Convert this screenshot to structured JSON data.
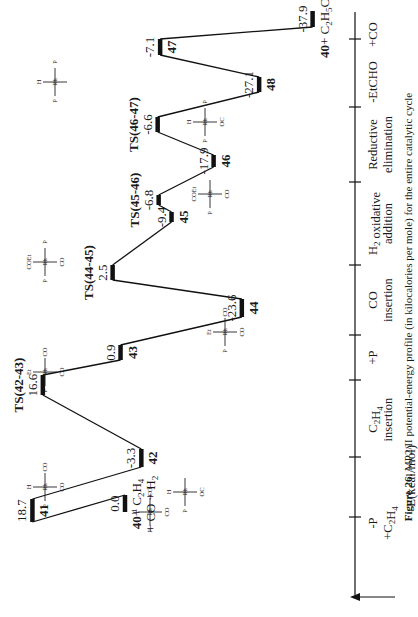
{
  "figure": {
    "caption_label": "Figure 26.",
    "caption_text": "MP2/II potential-energy profile (in kilocalories per mole) for the entire catalytic cycle",
    "axis_label": "E(kcal/mol)"
  },
  "chart_data": {
    "type": "line",
    "xlabel": "Reaction coordinate",
    "ylabel": "E(kcal/mol)",
    "orientation": "rotated 90 degrees counter-clockwise",
    "points": [
      {
        "id": "40",
        "label": "40 + C2H4 + CO + H2",
        "energy": 0.0,
        "pos": 0
      },
      {
        "id": "41",
        "label": "41",
        "energy": 18.7,
        "pos": 1
      },
      {
        "id": "42",
        "label": "42",
        "energy": -3.3,
        "pos": 2
      },
      {
        "id": "TS(42-43)",
        "label": "TS(42-43)",
        "energy": 16.6,
        "pos": 3
      },
      {
        "id": "43",
        "label": "43",
        "energy": 0.9,
        "pos": 4
      },
      {
        "id": "44",
        "label": "44",
        "energy": -23.6,
        "pos": 5
      },
      {
        "id": "TS(44-45)",
        "label": "TS(44-45)",
        "energy": 2.5,
        "pos": 6
      },
      {
        "id": "45",
        "label": "45",
        "energy": -9.4,
        "pos": 7
      },
      {
        "id": "TS(45-46)",
        "label": "TS(45-46)",
        "energy": -6.8,
        "pos": 8
      },
      {
        "id": "46",
        "label": "46",
        "energy": -17.9,
        "pos": 9
      },
      {
        "id": "TS(46-47)",
        "label": "TS(46-47)",
        "energy": -6.6,
        "pos": 10
      },
      {
        "id": "48",
        "label": "48",
        "energy": -27.1,
        "pos": 11
      },
      {
        "id": "47",
        "label": "47",
        "energy": -7.1,
        "pos": 12
      },
      {
        "id": "40b",
        "label": "40 + C2H5CHO",
        "energy": -37.9,
        "pos": 13
      }
    ],
    "steps": [
      {
        "line1": "-P",
        "line2": "+C2H4"
      },
      {
        "line1": "C2H4",
        "line2": "insertion"
      },
      {
        "line1": "+P",
        "line2": ""
      },
      {
        "line1": "CO",
        "line2": "insertion"
      },
      {
        "line1": "H2 oxidative",
        "line2": "addition"
      },
      {
        "line1": "Reductive",
        "line2": "elimination"
      },
      {
        "line1": "-EtCHO",
        "line2": ""
      },
      {
        "line1": "+CO",
        "line2": ""
      }
    ]
  },
  "labels": {
    "p40_a": "40",
    "p40_b": "+ C",
    "p40_c": "+ CO + H",
    "p40end_a": "40",
    "p40end_b": "+ C",
    "p40end_c": "H",
    "p40end_d": "CHO"
  },
  "molecules": {
    "m41": {
      "top": "H",
      "center": "Rh",
      "left": "P",
      "right": "CO",
      "bottom": "CO"
    },
    "m40": {
      "top": "H",
      "center": "Rh",
      "left": "P",
      "right": "CO",
      "bottom": "CO",
      "wedge": "P"
    },
    "m42": {
      "top": "H",
      "center": "Rh",
      "left": "P",
      "bottom": "OC"
    },
    "m43": {
      "top": "Et",
      "center": "Rh",
      "left": "P",
      "right": "CO",
      "bottom": "CO"
    },
    "m44": {
      "top": "Et",
      "center": "Rh",
      "left": "P",
      "right": "CO",
      "bottom": "CO",
      "wedge": "P"
    },
    "m45": {
      "top": "COEt",
      "center": "Rh",
      "left": "P",
      "right": "P",
      "bottom": "CO"
    },
    "m46": {
      "top": "COEt",
      "center": "Rh",
      "h1": "H",
      "h2": "H",
      "bottom": "CO",
      "left": "P",
      "wedge": "P"
    },
    "m48": {
      "top": "H",
      "center": "Rh",
      "sub": "CHEt",
      "o": "O",
      "left": "P",
      "right": "P",
      "bottom": "OC"
    },
    "m47": {
      "top": "H",
      "center": "Rh",
      "left": "P",
      "right": "P",
      "co": "CO"
    }
  }
}
